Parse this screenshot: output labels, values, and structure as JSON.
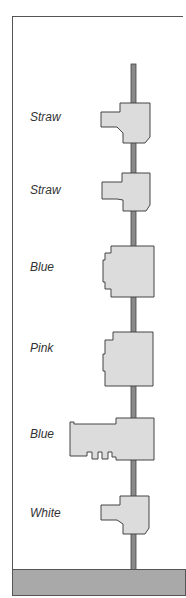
{
  "diagram": {
    "type": "stacked-wheel-assembly",
    "colors": {
      "rod": "#8a8a8a",
      "component_fill": "#dcdcdc",
      "outline": "#444444",
      "base": "#a9a9a9"
    },
    "components": [
      {
        "label": "Straw"
      },
      {
        "label": "Straw"
      },
      {
        "label": "Blue"
      },
      {
        "label": "Pink"
      },
      {
        "label": "Blue"
      },
      {
        "label": "White"
      }
    ]
  }
}
